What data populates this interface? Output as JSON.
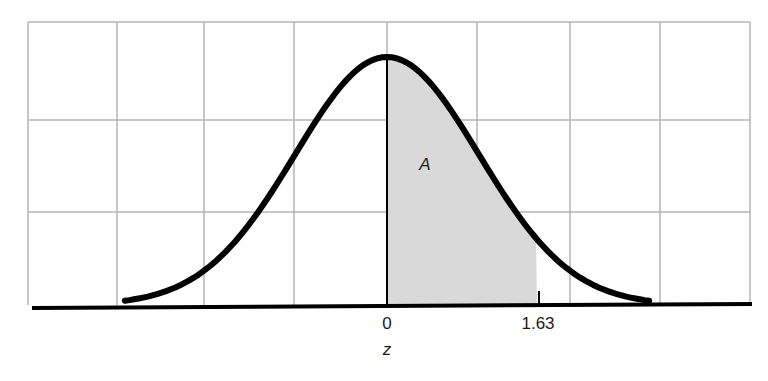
{
  "chart_data": {
    "type": "area",
    "title": "",
    "xlabel": "z",
    "ylabel": "",
    "x_ticks": [
      {
        "value": 0,
        "label": "0"
      },
      {
        "value": 1.63,
        "label": "1.63"
      }
    ],
    "xlim": [
      -3,
      3
    ],
    "grid": true,
    "grid_columns": 8,
    "grid_rows": 3,
    "curve": {
      "name": "standard normal density",
      "mean": 0,
      "sd": 1
    },
    "shaded_region": {
      "from": 0,
      "to": 1.63,
      "label": "A"
    },
    "annotations": [
      {
        "text": "A",
        "x": 0.4,
        "style": "italic"
      }
    ],
    "colors": {
      "curve": "#000000",
      "shade": "#d9d9d9",
      "grid": "#b5b5b5",
      "axis": "#000000"
    }
  },
  "labels": {
    "tick_zero": "0",
    "tick_163": "1.63",
    "axis_z": "z",
    "area_a": "A"
  }
}
